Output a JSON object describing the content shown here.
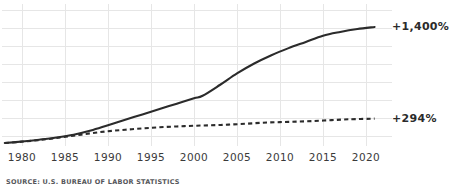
{
  "chart_data": {
    "type": "line",
    "title": "",
    "xlabel": "",
    "ylabel": "",
    "grid": true,
    "legend_position": "right-end-labels",
    "xlim": [
      1978,
      2021
    ],
    "ylim": [
      0,
      1500
    ],
    "xticks": [
      "1980",
      "1985",
      "1990",
      "1995",
      "2000",
      "2005",
      "2010",
      "2015",
      "2020"
    ],
    "xtick_values": [
      1980,
      1985,
      1990,
      1995,
      2000,
      2005,
      2010,
      2015,
      2020
    ],
    "series": [
      {
        "name": "+1,400%",
        "style": "solid",
        "end_label": "+1,400%",
        "end_value": 1400,
        "x": [
          1978,
          1980,
          1982,
          1984,
          1986,
          1988,
          1990,
          1992,
          1994,
          1996,
          1998,
          2000,
          2001,
          2003,
          2005,
          2007,
          2009,
          2011,
          2013,
          2015,
          2017,
          2019,
          2021
        ],
        "values": [
          0,
          18,
          40,
          66,
          100,
          150,
          215,
          280,
          345,
          410,
          475,
          540,
          570,
          700,
          840,
          960,
          1060,
          1145,
          1220,
          1295,
          1340,
          1375,
          1400
        ]
      },
      {
        "name": "+294%",
        "style": "dashed",
        "end_label": "+294%",
        "end_value": 294,
        "x": [
          1978,
          1980,
          1982,
          1984,
          1986,
          1988,
          1990,
          1992,
          1994,
          1996,
          1998,
          2000,
          2002,
          2004,
          2006,
          2008,
          2010,
          2012,
          2014,
          2016,
          2018,
          2021
        ],
        "values": [
          0,
          16,
          36,
          60,
          88,
          118,
          142,
          160,
          176,
          190,
          200,
          208,
          214,
          222,
          232,
          245,
          252,
          258,
          266,
          276,
          286,
          294
        ]
      }
    ],
    "source": "SOURCE: U.S. BUREAU OF LABOR STATISTICS"
  }
}
